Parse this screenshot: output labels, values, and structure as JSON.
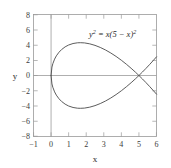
{
  "chart_data": {
    "type": "line",
    "title": "",
    "subtitle": "",
    "xlabel": "x",
    "ylabel": "y",
    "xlim": [
      -1,
      6
    ],
    "ylim": [
      -8,
      8
    ],
    "grid": false,
    "legend": "none",
    "annotations": [
      {
        "name": "equation-label",
        "text": "y2 = x(5 - x)2",
        "base_left": "y",
        "sup_left": "2",
        "equals": " = ",
        "base_right": "x(5 − x)",
        "sup_right": "2",
        "x": 2.8,
        "y": 6.1
      }
    ],
    "xticks": [
      -1,
      0,
      1,
      2,
      3,
      4,
      5,
      6
    ],
    "xticklabels": [
      "−1",
      "0",
      "1",
      "2",
      "3",
      "4",
      "5",
      "6"
    ],
    "yticks": [
      8,
      6,
      4,
      2,
      0,
      -2,
      -4,
      -6,
      -8
    ],
    "yticklabels": [
      "8",
      "6",
      "4",
      "2",
      "0",
      "−2",
      "−4",
      "−6",
      "−8"
    ],
    "series": [
      {
        "name": "upper-branch",
        "description": "y = +sqrt(x)*(5-x) for x in [0,6]",
        "x": [
          0,
          0.05,
          0.1,
          0.2,
          0.3,
          0.45,
          0.6,
          0.8,
          1.0,
          1.25,
          1.5,
          1.6667,
          1.9,
          2.2,
          2.5,
          2.8,
          3.1,
          3.4,
          3.7,
          4.0,
          4.3,
          4.6,
          4.8,
          5.0,
          5.2,
          5.4,
          5.6,
          5.8,
          6.0
        ],
        "y": [
          0,
          1.107,
          1.548,
          2.147,
          2.574,
          3.049,
          3.406,
          3.758,
          4.0,
          4.193,
          4.287,
          4.303,
          4.275,
          4.153,
          3.953,
          3.679,
          3.345,
          2.949,
          2.501,
          2.0,
          1.451,
          0.858,
          0.438,
          0,
          -0.456,
          -0.929,
          -1.42,
          -1.926,
          -2.449
        ]
      },
      {
        "name": "lower-branch",
        "description": "y = -sqrt(x)*(5-x) for x in [0,6]",
        "x": [
          0,
          0.05,
          0.1,
          0.2,
          0.3,
          0.45,
          0.6,
          0.8,
          1.0,
          1.25,
          1.5,
          1.6667,
          1.9,
          2.2,
          2.5,
          2.8,
          3.1,
          3.4,
          3.7,
          4.0,
          4.3,
          4.6,
          4.8,
          5.0,
          5.2,
          5.4,
          5.6,
          5.8,
          6.0
        ],
        "y": [
          0,
          -1.107,
          -1.548,
          -2.147,
          -2.574,
          -3.049,
          -3.406,
          -3.758,
          -4.0,
          -4.193,
          -4.287,
          -4.303,
          -4.275,
          -4.153,
          -3.953,
          -3.679,
          -3.345,
          -2.949,
          -2.501,
          -2.0,
          -1.451,
          -0.858,
          -0.438,
          0,
          0.456,
          0.929,
          1.42,
          1.926,
          2.449
        ]
      }
    ],
    "key_points": {
      "loop_start": [
        0,
        0
      ],
      "self_intersection": [
        5,
        0
      ],
      "loop_max_y": [
        1.6667,
        4.303
      ],
      "loop_min_y": [
        1.6667,
        -4.303
      ],
      "right_end_upper": [
        6,
        2.449
      ],
      "right_end_lower": [
        6,
        -2.449
      ]
    },
    "colors": {
      "background": "#ffffff",
      "frame": "#9a9a9a",
      "axis": "#9a9a9a",
      "curve": "#4a4a4a",
      "text": "#2b2b2b"
    }
  }
}
